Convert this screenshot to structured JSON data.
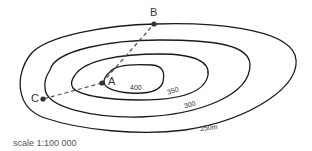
{
  "diagram": {
    "type": "contour-map",
    "points": {
      "A": {
        "label": "A"
      },
      "B": {
        "label": "B"
      },
      "C": {
        "label": "C"
      }
    },
    "contours": [
      {
        "label": "400",
        "value": 400
      },
      {
        "label": "350",
        "value": 350
      },
      {
        "label": "300",
        "value": 300
      },
      {
        "label": "250m",
        "value": 250
      }
    ],
    "lines": [
      {
        "from": "A",
        "to": "B",
        "style": "dashed"
      },
      {
        "from": "A",
        "to": "C",
        "style": "dashed"
      }
    ],
    "scale": "scale 1:100 000",
    "colors": {
      "line": "#1a1a1a",
      "dashed": "#555555",
      "text": "#333333"
    }
  }
}
